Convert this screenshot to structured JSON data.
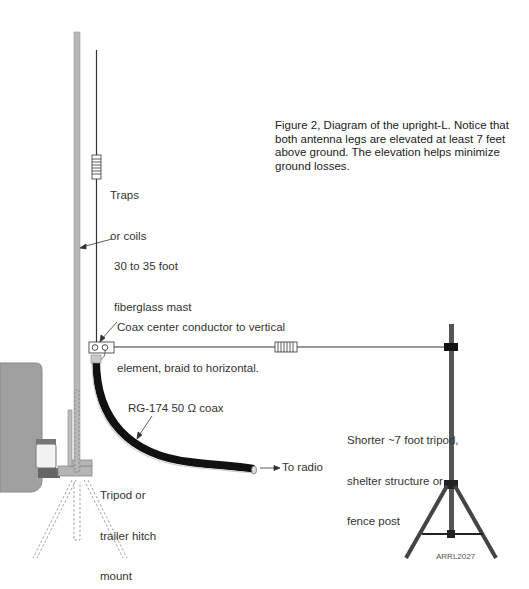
{
  "figure": {
    "caption": "Figure 2, Diagram of the upright-L. Notice that both antenna legs are elevated at least 7 feet above ground. The elevation helps minimize ground losses.",
    "credit": "ARRL2027"
  },
  "labels": {
    "traps_line1": "Traps",
    "traps_line2": "or coils",
    "mast_line1": "30 to 35 foot",
    "mast_line2": "fiberglass mast",
    "feed_line1": "Coax center conductor to vertical",
    "feed_line2": "element, braid to horizontal.",
    "coax": "RG-174 50 Ω coax",
    "to_radio": "To radio",
    "mount_line1": "Tripod or",
    "mount_line2": "trailer hitch",
    "mount_line3": "mount",
    "support_line1": "Shorter ~7 foot tripod,",
    "support_line2": "shelter structure or",
    "support_line3": "fence post"
  },
  "colors": {
    "mast": "#b5b5b5",
    "wire": "#333333",
    "coax": "#111111",
    "tripod": "#444444",
    "vehicle": "#9a9a9a"
  }
}
